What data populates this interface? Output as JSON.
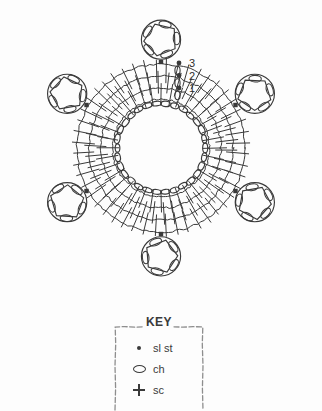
{
  "chart_data": {
    "type": "diagram",
    "round_labels": [
      "1",
      "2",
      "3"
    ],
    "rounds": [
      {
        "label": "1",
        "stitch": "sc",
        "stitch_count": 36,
        "radius_px": 54
      },
      {
        "label": "2",
        "stitch": "sc",
        "stitch_count": 42,
        "radius_px": 66
      },
      {
        "label": "3",
        "stitch": "sc",
        "stitch_count": 48,
        "radius_px": 78
      }
    ],
    "center_ring": {
      "stitch": "ch",
      "loop_count": 30,
      "radius_px": 44
    },
    "motifs": {
      "count": 6,
      "shape": "pentagon",
      "loops_per_motif": 5,
      "attachment": "sl st",
      "angles_deg": [
        270,
        330,
        30,
        90,
        150,
        210
      ]
    },
    "legend_position": "bottom-center",
    "ink_color": "#3a3a3a",
    "background_color": "#fdfdfd"
  },
  "chart": {
    "round_1": "1",
    "round_2": "2",
    "round_3": "3"
  },
  "key": {
    "title": "KEY",
    "items": [
      {
        "symbol": "sl-st-dot",
        "label": "sl st"
      },
      {
        "symbol": "ch-oval",
        "label": "ch"
      },
      {
        "symbol": "sc-plus",
        "label": "sc"
      }
    ]
  },
  "colors": {
    "ink": "#3a3a3a",
    "ink_light": "#6e6e6e",
    "background": "#fdfdfd"
  }
}
